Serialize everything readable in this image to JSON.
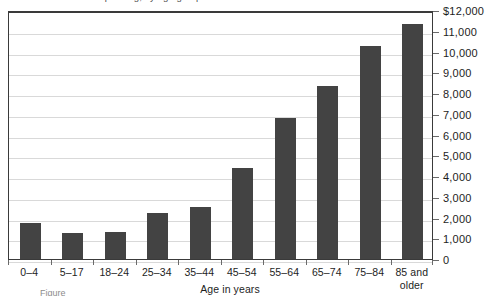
{
  "figure": {
    "title_sliver": "Personal health care spending, by age group",
    "caption_sliver": "Figure"
  },
  "axis": {
    "x_title": "Age in years",
    "y_tick_labels": [
      "$12,000",
      "11,000",
      "10,000",
      "9,000",
      "8,000",
      "7,000",
      "6,000",
      "5,000",
      "4,000",
      "3,000",
      "2,000",
      "1,000",
      "0"
    ]
  },
  "style": {
    "bar_color": "#434343",
    "gridline_color": "#d9d9d9",
    "frame_color": "#3a3a3a",
    "text_color": "#1d1d1d"
  },
  "chart_data": {
    "type": "bar",
    "title": "Personal health care spending, by age group",
    "xlabel": "Age in years",
    "ylabel": "",
    "ylim": [
      0,
      12000
    ],
    "ytick_step": 1000,
    "grid": true,
    "legend": null,
    "categories": [
      "0–4",
      "5–17",
      "18–24",
      "25–34",
      "35–44",
      "45–54",
      "55–64",
      "65–74",
      "75–84",
      "85 and older"
    ],
    "values": [
      1750,
      1250,
      1300,
      2200,
      2500,
      4400,
      6800,
      8350,
      10250,
      11350
    ],
    "value_prefix": "$"
  }
}
